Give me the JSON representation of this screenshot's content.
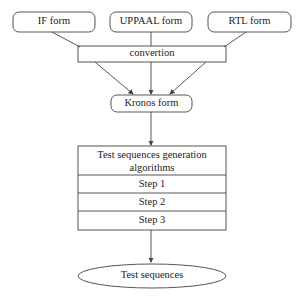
{
  "diagram": {
    "sources": [
      {
        "label": "IF form"
      },
      {
        "label": "UPPAAL form"
      },
      {
        "label": "RTL form"
      }
    ],
    "conversion": {
      "label": "convertion"
    },
    "kronos": {
      "label": "Kronos form"
    },
    "generator": {
      "title": "Test sequences generation algorithms",
      "title_line1": "Test sequences generation",
      "title_line2": "algorithms",
      "steps": [
        "Step 1",
        "Step 2",
        "Step 3"
      ]
    },
    "output": {
      "label": "Test sequences"
    }
  }
}
